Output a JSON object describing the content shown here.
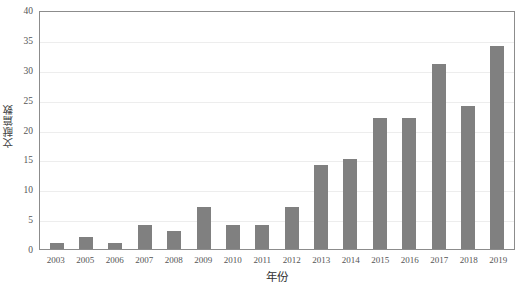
{
  "chart_data": {
    "type": "bar",
    "title": "",
    "subtitle": "",
    "xlabel": "年份",
    "ylabel": "文献篇数",
    "categories": [
      "2003",
      "2005",
      "2006",
      "2007",
      "2008",
      "2009",
      "2010",
      "2011",
      "2012",
      "2013",
      "2014",
      "2015",
      "2016",
      "2017",
      "2018",
      "2019"
    ],
    "values": [
      1,
      2,
      1,
      4,
      3,
      7,
      4,
      4,
      7,
      14,
      15,
      22,
      22,
      31,
      24,
      34
    ],
    "series": [
      {
        "name": "文献篇数",
        "values": [
          1,
          2,
          1,
          4,
          3,
          7,
          4,
          4,
          7,
          14,
          15,
          22,
          22,
          31,
          24,
          34
        ]
      }
    ],
    "ylim": [
      0,
      40
    ],
    "ytick_step": 5,
    "yticks": [
      0,
      5,
      10,
      15,
      20,
      25,
      30,
      35,
      40
    ],
    "xticks": [
      "2003",
      "2005",
      "2006",
      "2007",
      "2008",
      "2009",
      "2010",
      "2011",
      "2012",
      "2013",
      "2014",
      "2015",
      "2016",
      "2017",
      "2018",
      "2019"
    ],
    "grid": "horizontal",
    "legend": "none",
    "bar_color": "#808080",
    "gridline_color": "#ededed",
    "axis_color": "#8c8c8c",
    "background_color": "#ffffff",
    "annotations": []
  }
}
